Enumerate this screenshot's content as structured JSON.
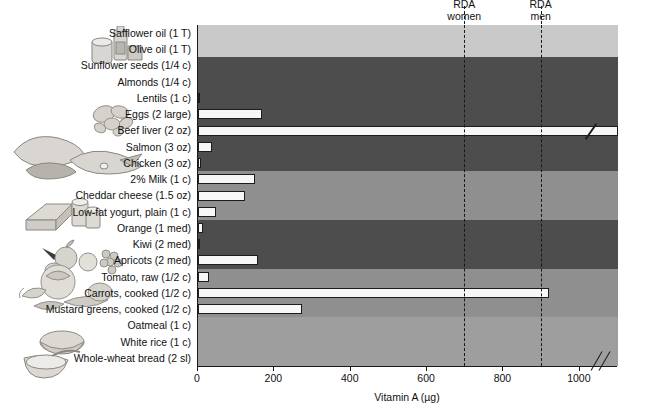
{
  "chart_data": {
    "type": "bar",
    "orientation": "horizontal",
    "title": "",
    "xlabel": "Vitamin A (µg)",
    "ylabel": "",
    "xlim": [
      0,
      1100
    ],
    "xticks": [
      0,
      200,
      400,
      600,
      800,
      1000
    ],
    "xticklabels": [
      "0",
      "200",
      "400",
      "600",
      "800",
      "1000"
    ],
    "grid": false,
    "legend": "none",
    "axis_break": true,
    "categories": [
      "Safflower oil (1 T)",
      "Olive oil (1 T)",
      "Sunflower seeds (1/4 c)",
      "Almonds (1/4 c)",
      "Lentils (1 c)",
      "Eggs (2 large)",
      "Beef liver (2 oz)",
      "Salmon (3 oz)",
      "Chicken (3 oz)",
      "2% Milk (1 c)",
      "Cheddar cheese (1.5 oz)",
      "Low-fat yogurt, plain (1 c)",
      "Orange (1 med)",
      "Kiwi (2 med)",
      "Apricots (2 med)",
      "Tomato, raw (1/2 c)",
      "Carrots, cooked (1/2 c)",
      "Mustard greens, cooked (1/2 c)",
      "Oatmeal (1 c)",
      "White rice (1 c)",
      "Whole-wheat bread (2 sl)"
    ],
    "values": [
      0,
      0,
      0,
      0,
      5,
      168,
      1100,
      36,
      8,
      150,
      122,
      48,
      13,
      5,
      158,
      30,
      920,
      273,
      0,
      0,
      0
    ],
    "value_truncated": [
      false,
      false,
      false,
      false,
      false,
      false,
      true,
      false,
      false,
      false,
      false,
      false,
      false,
      false,
      false,
      false,
      false,
      false,
      false,
      false,
      false
    ],
    "annotations": [
      {
        "label_line1": "RDA",
        "label_line2": "women",
        "value": 700
      },
      {
        "label_line1": "RDA",
        "label_line2": "men",
        "value": 900
      }
    ],
    "food_groups": [
      {
        "name": "fats-and-oils",
        "start": 0,
        "end": 1,
        "shade": "#c9c9c9"
      },
      {
        "name": "protein-foods",
        "start": 2,
        "end": 8,
        "shade": "#4d4d4d"
      },
      {
        "name": "dairy",
        "start": 9,
        "end": 11,
        "shade": "#8f8f8f"
      },
      {
        "name": "fruits",
        "start": 12,
        "end": 14,
        "shade": "#4d4d4d"
      },
      {
        "name": "vegetables",
        "start": 15,
        "end": 17,
        "shade": "#8f8f8f"
      },
      {
        "name": "grains",
        "start": 18,
        "end": 20,
        "shade": "#9e9e9e"
      }
    ]
  },
  "colors": {
    "bar_fill": "#f7f7f5",
    "bar_stroke": "#1c1c1c",
    "axis": "#1a1a1a",
    "plot_background": "#9a9a9a",
    "page_background": "#ffffff"
  },
  "axis": {
    "title": "Vitamin A (µg)"
  },
  "rda": {
    "women": {
      "line1": "RDA",
      "line2": "women"
    },
    "men": {
      "line1": "RDA",
      "line2": "men"
    }
  },
  "art": {
    "oils": "oil-bottle-and-butter-illustration",
    "nuts": "nuts-and-seeds-illustration",
    "protein": "meat-fish-poultry-illustration",
    "dairy": "cheese-and-milk-illustration",
    "fruit": "fruit-basket-illustration",
    "vegetables": "vegetables-illustration",
    "grains": "bread-and-oatmeal-illustration"
  }
}
